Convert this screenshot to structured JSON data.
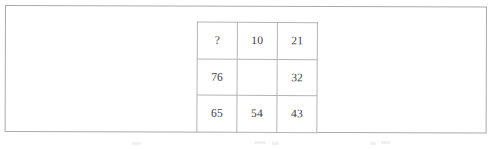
{
  "document": {
    "type": "scanned-figure",
    "background_color": "#ffffff",
    "frame_border_color": "#a9a9ad",
    "grid_border_color": "#b4b4b8",
    "text_color": "#3d3d42"
  },
  "puzzle_grid": {
    "rows": 3,
    "columns": 3,
    "missing_marker": "?",
    "cells": [
      [
        {
          "value": "?",
          "empty": false
        },
        {
          "value": "10",
          "empty": false
        },
        {
          "value": "21",
          "empty": false
        }
      ],
      [
        {
          "value": "76",
          "empty": false
        },
        {
          "value": "",
          "empty": true
        },
        {
          "value": "32",
          "empty": false
        }
      ],
      [
        {
          "value": "65",
          "empty": false
        },
        {
          "value": "54",
          "empty": false
        },
        {
          "value": "43",
          "empty": false
        }
      ]
    ]
  }
}
